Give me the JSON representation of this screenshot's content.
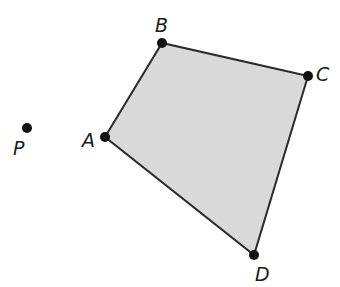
{
  "diagram": {
    "type": "quadrilateral",
    "fill_color": "#d9d9d9",
    "stroke_color": "#2a2a2a",
    "vertices": [
      {
        "label": "A",
        "x": 105,
        "y": 137,
        "lx": 82,
        "ly": 147
      },
      {
        "label": "B",
        "x": 162,
        "y": 43,
        "lx": 155,
        "ly": 32
      },
      {
        "label": "C",
        "x": 308,
        "y": 76,
        "lx": 316,
        "ly": 81
      },
      {
        "label": "D",
        "x": 254,
        "y": 255,
        "lx": 255,
        "ly": 281
      }
    ],
    "external_point": {
      "label": "P",
      "x": 27,
      "y": 128,
      "lx": 13,
      "ly": 155
    }
  }
}
